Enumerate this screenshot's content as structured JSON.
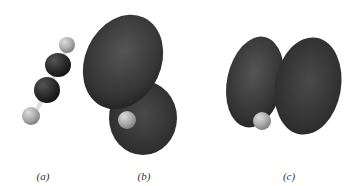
{
  "figure": {
    "panels": [
      {
        "id": "a",
        "label": "(a)",
        "content": "ball-and-stick model H–C≡C–H"
      },
      {
        "id": "b",
        "label": "(b)",
        "content": "orbital with two lobes stacked diagonally, H atom visible"
      },
      {
        "id": "c",
        "label": "(c)",
        "content": "orbital with two lobes side by side, H atom visible"
      }
    ],
    "colors": {
      "carbon": "#2a2a2a",
      "hydrogen": "#b0b0b0",
      "lobe": "#3a3a3a",
      "background": "#ffffff"
    }
  }
}
